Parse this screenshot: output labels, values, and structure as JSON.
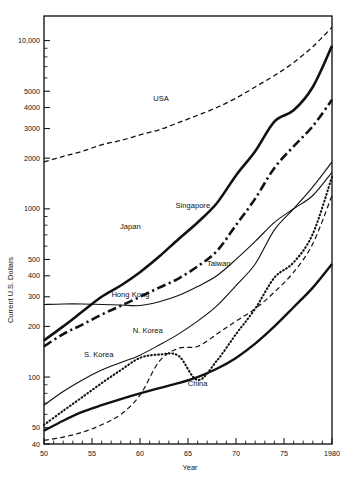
{
  "chart_data": {
    "type": "line",
    "title": "",
    "xlabel": "Year",
    "ylabel": "Current U.S. Dollars",
    "yscale": "log",
    "ylim": [
      40,
      14000
    ],
    "xlim": [
      50,
      80
    ],
    "grid": false,
    "legend_position": "inline-labels",
    "y_tick_labels": [
      "40",
      "50",
      "100",
      "200",
      "300",
      "400",
      "500",
      "1000",
      "2000",
      "3000",
      "4000",
      "5000",
      "10,000"
    ],
    "y_tick_values": [
      40,
      50,
      100,
      200,
      300,
      400,
      500,
      1000,
      2000,
      3000,
      4000,
      5000,
      10000
    ],
    "x_tick_labels": [
      "50",
      "55",
      "60",
      "65",
      "70",
      "75",
      "1980"
    ],
    "x_tick_values": [
      50,
      55,
      60,
      65,
      70,
      75,
      80
    ],
    "x": [
      50,
      52,
      54,
      56,
      58,
      60,
      62,
      64,
      66,
      68,
      70,
      72,
      74,
      76,
      78,
      80
    ],
    "series": [
      {
        "name": "USA",
        "style": "dashed",
        "width": 1.3,
        "label_x": 62.2,
        "label_y": 4350,
        "values": [
          1900,
          2050,
          2200,
          2400,
          2550,
          2750,
          2950,
          3250,
          3600,
          4000,
          4550,
          5300,
          6200,
          7400,
          9200,
          12000
        ]
      },
      {
        "name": "Japan",
        "style": "solid",
        "width": 2.6,
        "label_x": 59.0,
        "label_y": 760,
        "values": [
          165,
          200,
          245,
          300,
          350,
          420,
          520,
          660,
          830,
          1080,
          1580,
          2200,
          3300,
          3850,
          5300,
          9300
        ]
      },
      {
        "name": "Singapore",
        "style": "dashdot",
        "width": 2.6,
        "label_x": 65.5,
        "label_y": 1010,
        "values": [
          152,
          180,
          205,
          235,
          265,
          300,
          340,
          385,
          455,
          560,
          800,
          1150,
          1750,
          2350,
          3100,
          4450
        ]
      },
      {
        "name": "Taiwan",
        "style": "solid",
        "width": 1.1,
        "label_x": 68.2,
        "label_y": 455,
        "values": [
          68,
          82,
          96,
          110,
          122,
          135,
          155,
          180,
          215,
          265,
          350,
          470,
          750,
          1000,
          1350,
          1900
        ]
      },
      {
        "name": "Hong Kong",
        "style": "solid",
        "width": 1.1,
        "label_x": 59.0,
        "label_y": 300,
        "values": [
          270,
          272,
          272,
          270,
          268,
          266,
          280,
          305,
          345,
          400,
          500,
          640,
          830,
          1000,
          1200,
          1650
        ]
      },
      {
        "name": "S. Korea",
        "style": "dotted",
        "width": 2.1,
        "label_x": 55.7,
        "label_y": 131,
        "values": [
          52,
          63,
          76,
          92,
          110,
          130,
          136,
          134,
          96,
          125,
          180,
          255,
          390,
          480,
          710,
          1550
        ]
      },
      {
        "name": "N. Korea",
        "style": "dashed",
        "width": 1.2,
        "label_x": 60.8,
        "label_y": 182,
        "values": [
          42,
          44,
          47,
          52,
          60,
          78,
          124,
          148,
          152,
          180,
          215,
          255,
          320,
          420,
          620,
          1200
        ]
      },
      {
        "name": "China",
        "style": "solid",
        "width": 2.4,
        "label_x": 66.0,
        "label_y": 88,
        "values": [
          48,
          55,
          62,
          68,
          74,
          80,
          86,
          92,
          100,
          112,
          130,
          158,
          200,
          260,
          340,
          470
        ]
      }
    ]
  }
}
